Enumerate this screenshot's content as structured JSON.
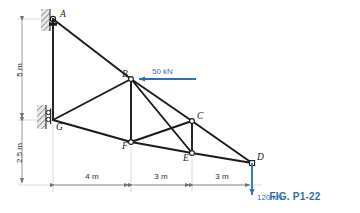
{
  "figure": {
    "caption": "FIG. P1-22",
    "type": "planar truss free-body diagram",
    "accent_color": "#2f6fae",
    "member_color": "#1a1a1a",
    "dimension_color": "#8a8a8a"
  },
  "joints": [
    {
      "id": "A",
      "label": "A",
      "x": 53,
      "y": 19,
      "support": "pin",
      "label_dx": 7,
      "label_dy": -2
    },
    {
      "id": "B",
      "label": "B",
      "x": 131,
      "y": 79,
      "support": "none",
      "label_dx": -9,
      "label_dy": -2
    },
    {
      "id": "C",
      "label": "C",
      "x": 192,
      "y": 121,
      "support": "none",
      "label_dx": 5,
      "label_dy": -2
    },
    {
      "id": "D",
      "label": "D",
      "x": 252,
      "y": 163,
      "support": "none",
      "label_dx": 5,
      "label_dy": -3
    },
    {
      "id": "E",
      "label": "E",
      "x": 192,
      "y": 153,
      "support": "none",
      "label_dx": -9,
      "label_dy": 8
    },
    {
      "id": "F",
      "label": "F",
      "x": 131,
      "y": 142,
      "support": "none",
      "label_dx": -9,
      "label_dy": 7
    },
    {
      "id": "G",
      "label": "G",
      "x": 53,
      "y": 120,
      "support": "roller",
      "label_dx": 3,
      "label_dy": 10
    }
  ],
  "members": [
    {
      "from": "A",
      "to": "B"
    },
    {
      "from": "B",
      "to": "C"
    },
    {
      "from": "C",
      "to": "D"
    },
    {
      "from": "A",
      "to": "G"
    },
    {
      "from": "G",
      "to": "F"
    },
    {
      "from": "F",
      "to": "E"
    },
    {
      "from": "E",
      "to": "D"
    },
    {
      "from": "G",
      "to": "B"
    },
    {
      "from": "B",
      "to": "F"
    },
    {
      "from": "B",
      "to": "E"
    },
    {
      "from": "F",
      "to": "C"
    },
    {
      "from": "C",
      "to": "E"
    }
  ],
  "loads": [
    {
      "id": "load-50",
      "label": "50 kN",
      "magnitude": 50,
      "unit": "kN",
      "direction": "horizontal-left",
      "applied_at": "B",
      "tail_x": 196,
      "tail_y": 79,
      "head_x": 137,
      "head_y": 79,
      "text_x": 152,
      "text_y": 74
    },
    {
      "id": "load-120",
      "label": "120 kN",
      "magnitude": 120,
      "unit": "kN",
      "direction": "vertical-down",
      "applied_at": "D",
      "tail_x": 252,
      "tail_y": 163,
      "head_x": 252,
      "head_y": 197,
      "text_x": 257,
      "text_y": 197
    }
  ],
  "dimensions": {
    "vertical": [
      {
        "id": "dim-5m",
        "label": "5 m",
        "value": 5,
        "unit": "m",
        "x": 22,
        "y_top": 19,
        "y_bottom": 120,
        "text_y": 70
      },
      {
        "id": "dim-2.5m",
        "label": "2.5 m",
        "value": 2.5,
        "unit": "m",
        "x": 22,
        "y_top": 120,
        "y_bottom": 185,
        "text_y": 153
      }
    ],
    "horizontal": [
      {
        "id": "dim-4m",
        "label": "4 m",
        "value": 4,
        "unit": "m",
        "y": 185,
        "x_left": 53,
        "x_right": 131,
        "text_x": 92
      },
      {
        "id": "dim-3m-1",
        "label": "3 m",
        "value": 3,
        "unit": "m",
        "y": 185,
        "x_left": 131,
        "x_right": 192,
        "text_x": 161
      },
      {
        "id": "dim-3m-2",
        "label": "3 m",
        "value": 3,
        "unit": "m",
        "y": 185,
        "x_left": 192,
        "x_right": 252,
        "text_x": 222
      }
    ]
  },
  "supports": {
    "pin": {
      "at": "A",
      "description": "pin support on hatched wall"
    },
    "roller": {
      "at": "G",
      "description": "roller support on hatched wall",
      "roller_count": 2
    }
  }
}
